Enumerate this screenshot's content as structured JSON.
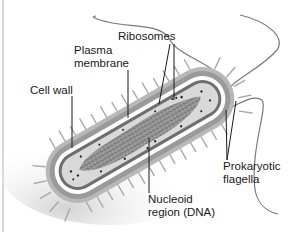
{
  "diagram": {
    "labels": {
      "ribosomes": "Ribosomes",
      "plasma_membrane_line1": "Plasma",
      "plasma_membrane_line2": "membrane",
      "cell_wall": "Cell wall",
      "flagella_line1": "Prokaryotic",
      "flagella_line2": "flagella",
      "nucleoid_line1": "Nucleoid",
      "nucleoid_line2": "region (DNA)"
    },
    "colors": {
      "background": "#ffffff",
      "capsule": "#b8b8b8",
      "cell_wall": "#ffffff",
      "membrane": "#6e6e6e",
      "cytoplasm": "#d9d9d9",
      "nucleoid": "#8a8a8a",
      "ribosome": "#222222",
      "flagellum": "#7a7a7a",
      "leader_line": "#1a1a1a",
      "label_text": "#1a1a1a"
    }
  }
}
